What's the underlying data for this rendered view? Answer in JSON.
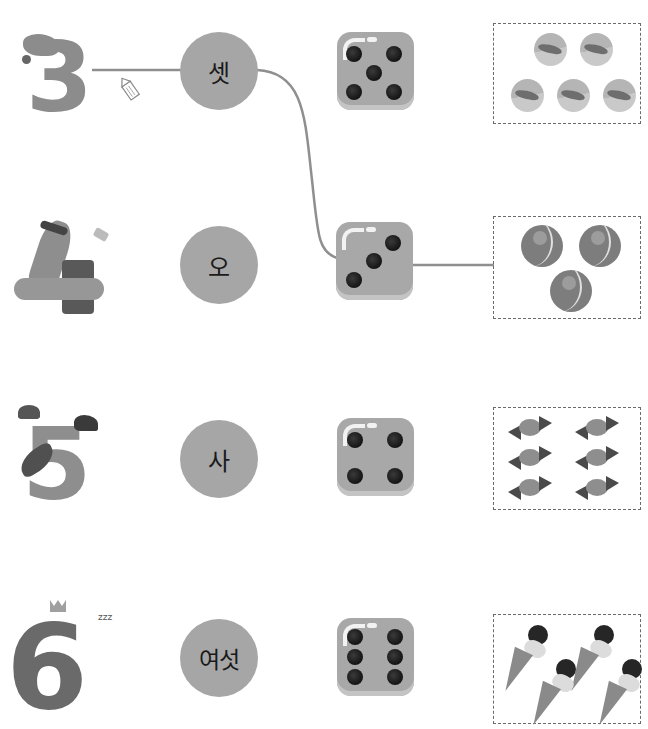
{
  "worksheet": {
    "rows": [
      {
        "character": {
          "numeral": "3",
          "name": "donkey-three-character"
        },
        "word": "셋",
        "die_value": 5,
        "objects": {
          "kind": "marbles",
          "count": 5
        }
      },
      {
        "character": {
          "numeral": "4",
          "name": "mole-hammer-character"
        },
        "word": "오",
        "die_value": 3,
        "objects": {
          "kind": "tennis-balls",
          "count": 3
        }
      },
      {
        "character": {
          "numeral": "5",
          "name": "parrot-five-character"
        },
        "word": "사",
        "die_value": 4,
        "objects": {
          "kind": "candies",
          "count": 6
        }
      },
      {
        "character": {
          "numeral": "6",
          "name": "snake-six-character"
        },
        "word": "여섯",
        "die_value": 6,
        "objects": {
          "kind": "ice-cream-cones",
          "count": 4
        }
      }
    ],
    "connections": [
      {
        "from": "row1-character",
        "to": "row1-word",
        "style": "straight"
      },
      {
        "from": "row1-word",
        "to": "row2-die",
        "style": "curve"
      },
      {
        "from": "row2-die",
        "to": "row2-objects",
        "style": "straight"
      }
    ],
    "colors": {
      "circle": "#a6a6a6",
      "die": "#a8a8a8",
      "pip": "#141414",
      "line": "#8f8f8f",
      "dashed_border": "#6a6a6a"
    }
  }
}
